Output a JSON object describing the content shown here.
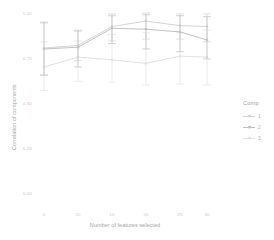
{
  "chart_data": {
    "type": "line",
    "title": "",
    "subtitle": "",
    "xlabel": "Number of features selected",
    "ylabel": "Correlation of components",
    "x": [
      5,
      10,
      15,
      20,
      25,
      30
    ],
    "xtick_labels": [
      "5",
      "10",
      "15",
      "20",
      "25",
      "30"
    ],
    "ytick_labels": [
      "0.00",
      "0.25",
      "0.50",
      "0.75",
      "1.00"
    ],
    "ytick_values": [
      0.0,
      0.25,
      0.5,
      0.75,
      1.0
    ],
    "ylim": [
      0.0,
      1.0
    ],
    "grid": false,
    "legend_position": "right",
    "legend_title": "Comp",
    "error_bars": true,
    "series": [
      {
        "name": "1",
        "color": "#d5d5d5",
        "values": [
          0.805,
          0.82,
          0.925,
          0.955,
          0.93,
          0.925
        ],
        "err_low": [
          0.655,
          0.735,
          0.845,
          0.855,
          0.855,
          0.84
        ],
        "err_high": [
          0.95,
          0.905,
          0.995,
          1.0,
          0.995,
          0.995
        ]
      },
      {
        "name": "2",
        "color": "#c2c2c2",
        "values": [
          0.8,
          0.81,
          0.915,
          0.91,
          0.895,
          0.85
        ],
        "err_low": [
          0.655,
          0.7,
          0.83,
          0.8,
          0.785,
          0.745
        ],
        "err_high": [
          0.945,
          0.9,
          0.985,
          0.99,
          0.985,
          0.98
        ]
      },
      {
        "name": "3",
        "color": "#e2e2e2",
        "values": [
          0.7,
          0.755,
          0.74,
          0.72,
          0.76,
          0.755
        ],
        "err_low": [
          0.57,
          0.62,
          0.615,
          0.6,
          0.605,
          0.6
        ],
        "err_high": [
          0.84,
          0.845,
          0.88,
          0.89,
          0.89,
          0.905
        ]
      }
    ]
  },
  "axes": {
    "xlabel": "Number of features selected",
    "ylabel": "Correlation of components"
  },
  "legend": {
    "title": "Comp",
    "items": [
      {
        "label": "1"
      },
      {
        "label": "2"
      },
      {
        "label": "3"
      }
    ]
  },
  "ticks": {
    "y": [
      "1.00",
      "0.75",
      "0.50",
      "0.25",
      "0.00"
    ],
    "x": [
      "5",
      "10",
      "15",
      "20",
      "25",
      "30"
    ]
  }
}
